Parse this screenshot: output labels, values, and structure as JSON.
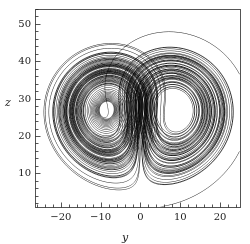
{
  "figure": {
    "background": "#ffffff",
    "line_color": "#000000",
    "frame_color": "#2a2a2a"
  },
  "axes": {
    "xlabel": "y",
    "ylabel": "z",
    "xticks": [
      -20,
      -10,
      0,
      10,
      20
    ],
    "xticklabels": [
      "−20",
      "−10",
      "0",
      "10",
      "20"
    ],
    "yticks": [
      10,
      20,
      30,
      40,
      50
    ],
    "yticklabels": [
      "10",
      "20",
      "30",
      "40",
      "50"
    ],
    "xlim": [
      -26.5,
      25.0
    ],
    "ylim": [
      1.0,
      54.0
    ],
    "minor_tick_step": 2,
    "minor_tick_step_y": 2,
    "frame": {
      "left": 35,
      "top": 9,
      "right": 240,
      "bottom": 207
    }
  },
  "chart_data": {
    "type": "line",
    "title": "",
    "xlabel": "y",
    "ylabel": "z",
    "xlim": [
      -26.5,
      25.0
    ],
    "ylim": [
      1.0,
      54.0
    ],
    "grid": false,
    "legend": "none",
    "system": {
      "name": "Lorenz system",
      "equations": [
        "dx/dt = sigma*(y - x)",
        "dy/dt = x*(rho - z) - y",
        "dz/dt = x*y - beta*z"
      ],
      "sigma": 10.0,
      "rho": 28.0,
      "beta": 2.6666666667,
      "initial_state": [
        0.0,
        1.0,
        1.05
      ],
      "dt": 0.0035,
      "steps": 26000,
      "plot_axes": [
        "y",
        "z"
      ]
    },
    "fixed_points": [
      {
        "y": -8.485,
        "z": 27.0
      },
      {
        "y": 8.485,
        "z": 27.0
      }
    ],
    "series": [
      {
        "name": "trajectory",
        "color": "#000000",
        "linewidth": 0.45,
        "x_key": "y",
        "y_key": "z"
      }
    ]
  }
}
